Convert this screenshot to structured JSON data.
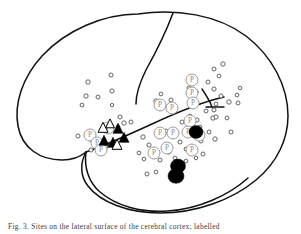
{
  "figure": {
    "view": "left lateral hemisphere",
    "background_color": "#ffffff",
    "outline_color": "#111111",
    "marker_colors": {
      "small_circle_stroke": "#555555",
      "p_circle_stroke": "#9a9a9a",
      "p_letter": "#8a8a8a",
      "triangle_filled": "#000000",
      "triangle_open_stroke": "#000000",
      "blob_fill": "#000000"
    },
    "legend_symbols": [
      {
        "name": "small-open-circle",
        "meaning": "site marker"
      },
      {
        "name": "p-circle",
        "label": "P",
        "meaning": "P-labelled site"
      },
      {
        "name": "filled-triangle",
        "meaning": "filled triangle site"
      },
      {
        "name": "open-triangle",
        "meaning": "open triangle site"
      },
      {
        "name": "black-blob",
        "meaning": "lesion / focus area"
      }
    ]
  },
  "caption": {
    "text": "Fig. 3. Sites on the lateral surface of the cerebral cortex; labelled"
  },
  "chart_data": {
    "type": "scatter",
    "xlabel": "",
    "ylabel": "",
    "xlim": [
      0,
      301
    ],
    "ylim": [
      0,
      234
    ],
    "grid": false,
    "legend": "none",
    "series": [
      {
        "name": "small-circles",
        "symbol": "open-circle",
        "points": [
          [
            88,
            82,
            2.2
          ],
          [
            111,
            75,
            2.0
          ],
          [
            86,
            96,
            2.2
          ],
          [
            98,
            97,
            2.0
          ],
          [
            82,
            105,
            1.9
          ],
          [
            112,
            91,
            2.1
          ],
          [
            120,
            117,
            2.0
          ],
          [
            124,
            123,
            2.2
          ],
          [
            92,
            140,
            2.0
          ],
          [
            106,
            147,
            1.8
          ],
          [
            78,
            136,
            2.0
          ],
          [
            91,
            150,
            2.0
          ],
          [
            118,
            127,
            1.8
          ],
          [
            131,
            122,
            2.0
          ],
          [
            112,
            105,
            1.7
          ],
          [
            156,
            101,
            2.2
          ],
          [
            161,
            94,
            1.9
          ],
          [
            171,
            100,
            2.0
          ],
          [
            166,
            131,
            2.0
          ],
          [
            143,
            137,
            2.2
          ],
          [
            149,
            145,
            2.1
          ],
          [
            139,
            153,
            1.9
          ],
          [
            144,
            159,
            1.8
          ],
          [
            147,
            174,
            2.0
          ],
          [
            156,
            172,
            1.9
          ],
          [
            175,
            131,
            1.8
          ],
          [
            182,
            122,
            2.0
          ],
          [
            189,
            88,
            2.0
          ],
          [
            196,
            92,
            2.2
          ],
          [
            190,
            116,
            1.9
          ],
          [
            197,
            120,
            2.1
          ],
          [
            200,
            127,
            1.9
          ],
          [
            206,
            111,
            2.0
          ],
          [
            213,
            118,
            2.2
          ],
          [
            214,
            69,
            2.0
          ],
          [
            223,
            64,
            2.2
          ],
          [
            219,
            76,
            1.9
          ],
          [
            208,
            82,
            2.0
          ],
          [
            214,
            89,
            2.1
          ],
          [
            221,
            96,
            2.0
          ],
          [
            229,
            102,
            2.2
          ],
          [
            216,
            104,
            1.9
          ],
          [
            214,
            110,
            2.0
          ],
          [
            216,
            117,
            2.1
          ],
          [
            227,
            118,
            1.9
          ],
          [
            209,
            132,
            2.0
          ],
          [
            215,
            139,
            2.2
          ],
          [
            201,
            141,
            2.0
          ],
          [
            195,
            150,
            1.9
          ],
          [
            203,
            154,
            2.0
          ],
          [
            196,
            158,
            1.8
          ],
          [
            186,
            149,
            1.9
          ],
          [
            180,
            142,
            2.0
          ],
          [
            186,
            161,
            1.9
          ],
          [
            231,
            132,
            2.0
          ],
          [
            237,
            95,
            1.9
          ],
          [
            238,
            103,
            2.0
          ],
          [
            240,
            88,
            1.8
          ],
          [
            169,
            152,
            2.0
          ],
          [
            175,
            158,
            1.9
          ],
          [
            160,
            160,
            2.0
          ]
        ]
      },
      {
        "name": "p-circles",
        "symbol": "labelled-circle",
        "label": "P",
        "points": [
          [
            90,
            135,
            6.0
          ],
          [
            97,
            143,
            6.0
          ],
          [
            101,
            150,
            6.0
          ],
          [
            108,
            128,
            6.0
          ],
          [
            160,
            105,
            6.0
          ],
          [
            172,
            108,
            6.0
          ],
          [
            192,
            80,
            6.0
          ],
          [
            192,
            93,
            6.0
          ],
          [
            193,
            103,
            6.0
          ],
          [
            190,
            121,
            6.0
          ],
          [
            160,
            133,
            6.0
          ],
          [
            173,
            133,
            6.0
          ],
          [
            188,
            132,
            6.0
          ],
          [
            154,
            153,
            6.0
          ],
          [
            167,
            148,
            6.0
          ],
          [
            192,
            150,
            6.0
          ],
          [
            199,
            135,
            6.0
          ]
        ]
      },
      {
        "name": "filled-triangles",
        "symbol": "filled-triangle",
        "points": [
          [
            118,
            129,
            5.0
          ],
          [
            104,
            141,
            5.0
          ],
          [
            124,
            138,
            5.0
          ],
          [
            113,
            143,
            5.0
          ]
        ]
      },
      {
        "name": "open-triangles",
        "symbol": "open-triangle",
        "points": [
          [
            103,
            128,
            5.0
          ],
          [
            117,
            145,
            5.0
          ],
          [
            110,
            124,
            4.4
          ]
        ]
      },
      {
        "name": "black-blobs",
        "symbol": "filled-blob",
        "points": [
          [
            196,
            132,
            7.0
          ],
          [
            178,
            166,
            7.5
          ],
          [
            176,
            176,
            8.0
          ]
        ]
      }
    ]
  }
}
